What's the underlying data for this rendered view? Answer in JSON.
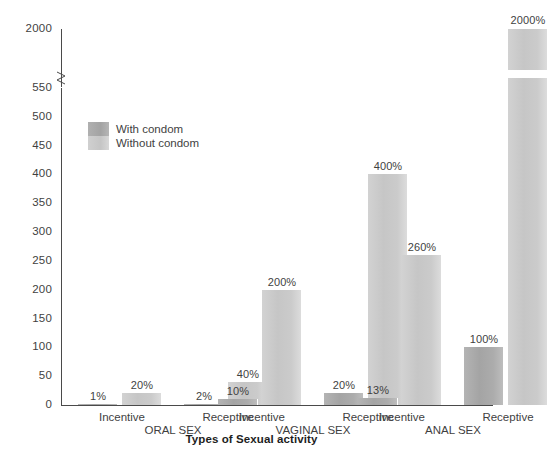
{
  "chart_data": {
    "type": "bar",
    "title": "",
    "xlabel": "Types of Sexual activity",
    "ylabel": "",
    "ylim": [
      0,
      550
    ],
    "grid": false,
    "legend_position": "inside-upper-left",
    "y_ticks": [
      "0",
      "50",
      "100",
      "150",
      "200",
      "250",
      "300",
      "350",
      "400",
      "450",
      "500",
      "550",
      "2000"
    ],
    "y_axis_break": true,
    "y_axis_break_note": "Axis breaks between 550 and 2000",
    "groups": [
      {
        "name": "ORAL SEX",
        "subcategories": [
          "Incentive",
          "Receptive"
        ]
      },
      {
        "name": "VAGINAL SEX",
        "subcategories": [
          "Incentive",
          "Receptive"
        ]
      },
      {
        "name": "ANAL SEX",
        "subcategories": [
          "Incentive",
          "Receptive"
        ]
      }
    ],
    "categories": [
      "Incentive / ORAL SEX",
      "Receptive / ORAL SEX",
      "Incentive / VAGINAL SEX",
      "Receptive / VAGINAL SEX",
      "Incentive / ANAL SEX",
      "Receptive / ANAL SEX"
    ],
    "series": [
      {
        "name": "With condom",
        "color": "#a8a8a8",
        "values": [
          1,
          2,
          10,
          20,
          13,
          100
        ],
        "labels": [
          "1%",
          "2%",
          "10%",
          "20%",
          "13%",
          "100%"
        ]
      },
      {
        "name": "Without condom",
        "color": "#cacaca",
        "values": [
          20,
          40,
          200,
          400,
          260,
          2000
        ],
        "labels": [
          "20%",
          "40%",
          "200%",
          "400%",
          "260%",
          "2000%"
        ]
      }
    ]
  },
  "legend": {
    "items": [
      {
        "label": "With condom",
        "color": "#a8a8a8"
      },
      {
        "label": "Without condom",
        "color": "#cacaca"
      }
    ]
  },
  "axis": {
    "x_title": "Types of Sexual activity"
  }
}
